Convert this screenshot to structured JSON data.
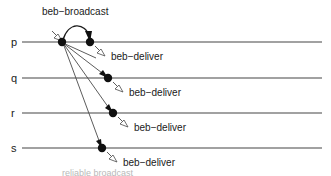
{
  "figure": {
    "bottom_caption": "reliable broadcast"
  },
  "colors": {
    "timeline": "#444444",
    "message_line": "#4a4a4a",
    "arc": "#1c1c1c",
    "dot": "#101010",
    "text": "#1a1a1a",
    "background": "#ffffff",
    "caption": "#b9b9b9"
  },
  "processes": [
    {
      "label": "p",
      "y": 42
    },
    {
      "label": "q",
      "y": 78
    },
    {
      "label": "r",
      "y": 113
    },
    {
      "label": "s",
      "y": 148
    }
  ],
  "timeline": {
    "x_start": 22,
    "x_end": 322
  },
  "events": {
    "broadcast": {
      "label": "beb−broadcast",
      "label_x": 42,
      "label_y": 14,
      "origin_x": 62,
      "origin_y": 42,
      "target_x": 90,
      "target_y": 42
    },
    "deliveries": [
      {
        "process": "p",
        "label": "beb−deliver",
        "dot_x": 90,
        "dot_y": 42,
        "arrow_x": 96,
        "arrow_y": 47,
        "label_x": 112,
        "label_y": 57
      },
      {
        "process": "q",
        "label": "beb−deliver",
        "dot_x": 108,
        "dot_y": 78,
        "arrow_x": 114,
        "arrow_y": 83,
        "label_x": 130,
        "label_y": 93
      },
      {
        "process": "r",
        "label": "beb−deliver",
        "dot_x": 113,
        "dot_y": 113,
        "arrow_x": 119,
        "arrow_y": 118,
        "label_x": 135,
        "label_y": 128
      },
      {
        "process": "s",
        "label": "beb−deliver",
        "dot_x": 102,
        "dot_y": 148,
        "arrow_x": 108,
        "arrow_y": 153,
        "label_x": 124,
        "label_y": 163
      }
    ]
  }
}
